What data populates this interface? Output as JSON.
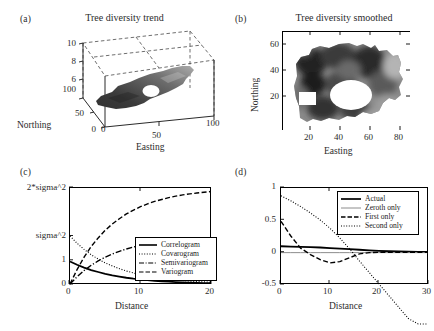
{
  "figure": {
    "background": "#ffffff",
    "panels": [
      "a",
      "b",
      "c",
      "d"
    ]
  },
  "panel_a": {
    "label": "(a)",
    "title": "Tree diversity trend",
    "xlabel": "Easting",
    "ylabel": "Northing",
    "x_ticks": [
      "0",
      "50",
      "100"
    ],
    "y_ticks": [
      "0",
      "50",
      "100"
    ],
    "z_ticks": [
      "6",
      "8",
      "10"
    ]
  },
  "panel_b": {
    "label": "(b)",
    "title": "Tree diversity smoothed",
    "xlabel": "Easting",
    "ylabel": "Northing",
    "x_ticks": [
      "20",
      "40",
      "60",
      "80"
    ],
    "y_ticks": [
      "20",
      "40",
      "60"
    ]
  },
  "panel_c": {
    "label": "(c)",
    "xlabel": "Distance",
    "x_ticks": [
      "0",
      "10",
      "20"
    ],
    "y_ticks": [
      "0",
      "1",
      "sigma^2",
      "2*sigma^2"
    ],
    "legend": [
      {
        "label": "Correlogram",
        "style": "solid"
      },
      {
        "label": "Covarogram",
        "style": "dotted"
      },
      {
        "label": "Semivariogram",
        "style": "dashdot"
      },
      {
        "label": "Variogram",
        "style": "dashed"
      }
    ]
  },
  "panel_d": {
    "label": "(d)",
    "xlabel": "Distance",
    "x_ticks": [
      "0",
      "10",
      "20",
      "30"
    ],
    "y_ticks": [
      "-0.5",
      "0",
      "0.5",
      "1"
    ],
    "legend": [
      {
        "label": "Actual",
        "style": "solid"
      },
      {
        "label": "Zeroth only",
        "style": "solid-thin"
      },
      {
        "label": "First only",
        "style": "dashed"
      },
      {
        "label": "Second only",
        "style": "dotted"
      }
    ]
  },
  "chart_data": [
    {
      "id": "panel_a",
      "type": "surface",
      "title": "Tree diversity trend",
      "xlabel": "Easting",
      "ylabel": "Northing",
      "zlabel": "",
      "xlim": [
        0,
        100
      ],
      "ylim": [
        0,
        100
      ],
      "zlim": [
        5,
        11
      ],
      "x_ticks": [
        0,
        50,
        100
      ],
      "y_ticks": [
        0,
        50,
        100
      ],
      "z_ticks": [
        6,
        8,
        10
      ],
      "grid": true,
      "description": "3D trend surface of tree diversity over an irregular study-area footprint, viewed in perspective with dashed wireframe bounding box; surface shaded dark (low) to light (high) grayscale, with an interior hole near the centre-right.",
      "colormap": "gray"
    },
    {
      "id": "panel_b",
      "type": "heatmap",
      "title": "Tree diversity smoothed",
      "xlabel": "Easting",
      "ylabel": "Northing",
      "xlim": [
        5,
        88
      ],
      "ylim": [
        5,
        70
      ],
      "x_ticks": [
        20,
        40,
        60,
        80
      ],
      "y_ticks": [
        20,
        40,
        60
      ],
      "grid": false,
      "colormap": "gray",
      "description": "Smoothed grayscale raster of tree diversity over the same irregular footprint; darker patches indicate lower values, lighter patches higher values; white (no-data) ellipse near Easting 45-60 / Northing 20-35 and a small white square near Easting 12-20 / Northing 18-25."
    },
    {
      "id": "panel_c",
      "type": "line",
      "title": "",
      "xlabel": "Distance",
      "ylabel": "",
      "xlim": [
        0,
        20
      ],
      "ylim": [
        0,
        2
      ],
      "x_ticks": [
        0,
        10,
        20
      ],
      "y_tick_values": [
        0,
        0.5,
        1,
        2
      ],
      "y_tick_labels": [
        "0",
        "1",
        "sigma^2",
        "2*sigma^2"
      ],
      "grid": false,
      "legend_position": "lower right",
      "x": [
        0,
        1,
        2,
        3,
        4,
        5,
        6,
        7,
        8,
        9,
        10,
        11,
        12,
        13,
        14,
        15,
        16,
        17,
        18,
        19,
        20
      ],
      "series": [
        {
          "name": "Correlogram",
          "style": "solid",
          "values": [
            0.47,
            0.4,
            0.34,
            0.29,
            0.25,
            0.21,
            0.18,
            0.155,
            0.13,
            0.11,
            0.095,
            0.08,
            0.068,
            0.057,
            0.048,
            0.04,
            0.034,
            0.028,
            0.024,
            0.02,
            0.017
          ]
        },
        {
          "name": "Covarogram",
          "style": "dotted",
          "values": [
            1.0,
            0.85,
            0.72,
            0.61,
            0.52,
            0.44,
            0.375,
            0.32,
            0.27,
            0.23,
            0.195,
            0.165,
            0.14,
            0.12,
            0.1,
            0.085,
            0.072,
            0.061,
            0.052,
            0.044,
            0.037
          ]
        },
        {
          "name": "Semivariogram",
          "style": "dashdot",
          "values": [
            0.0,
            0.15,
            0.28,
            0.39,
            0.48,
            0.56,
            0.625,
            0.68,
            0.73,
            0.77,
            0.805,
            0.835,
            0.86,
            0.88,
            0.9,
            0.915,
            0.928,
            0.939,
            0.948,
            0.956,
            0.963
          ]
        },
        {
          "name": "Variogram",
          "style": "dashed",
          "values": [
            0.0,
            0.3,
            0.56,
            0.78,
            0.96,
            1.12,
            1.25,
            1.36,
            1.46,
            1.54,
            1.61,
            1.67,
            1.72,
            1.76,
            1.8,
            1.83,
            1.856,
            1.878,
            1.896,
            1.912,
            1.926
          ]
        }
      ]
    },
    {
      "id": "panel_d",
      "type": "line",
      "title": "",
      "xlabel": "Distance",
      "ylabel": "",
      "xlim": [
        0,
        30
      ],
      "ylim": [
        -0.5,
        1.0
      ],
      "x_ticks": [
        0,
        10,
        20,
        30
      ],
      "y_ticks": [
        -0.5,
        0,
        0.5,
        1
      ],
      "grid": false,
      "legend_position": "upper right",
      "x": [
        0,
        2,
        4,
        6,
        8,
        10,
        12,
        14,
        16,
        18,
        20,
        22,
        24,
        26,
        28,
        30
      ],
      "series": [
        {
          "name": "Actual",
          "style": "solid",
          "values": [
            0.09,
            0.085,
            0.08,
            0.075,
            0.07,
            0.062,
            0.054,
            0.045,
            0.035,
            0.026,
            0.018,
            0.012,
            0.008,
            0.004,
            0.002,
            0.0
          ]
        },
        {
          "name": "Zeroth only",
          "style": "solid-thin",
          "values": [
            -0.01,
            -0.01,
            -0.01,
            -0.01,
            -0.01,
            -0.01,
            -0.01,
            -0.01,
            -0.01,
            -0.01,
            -0.01,
            -0.01,
            -0.01,
            -0.01,
            -0.01,
            -0.01
          ]
        },
        {
          "name": "First only",
          "style": "dashed",
          "values": [
            0.48,
            0.25,
            0.06,
            -0.04,
            -0.12,
            -0.17,
            -0.15,
            -0.09,
            -0.03,
            -0.01,
            -0.005,
            -0.005,
            -0.005,
            -0.005,
            -0.005,
            -0.005
          ]
        },
        {
          "name": "Second only",
          "style": "dotted",
          "values": [
            0.88,
            0.8,
            0.71,
            0.61,
            0.5,
            0.37,
            0.22,
            0.05,
            -0.14,
            -0.32,
            -0.5,
            -0.68,
            -0.86,
            -1.04,
            -1.22,
            -1.4
          ]
        }
      ]
    }
  ]
}
